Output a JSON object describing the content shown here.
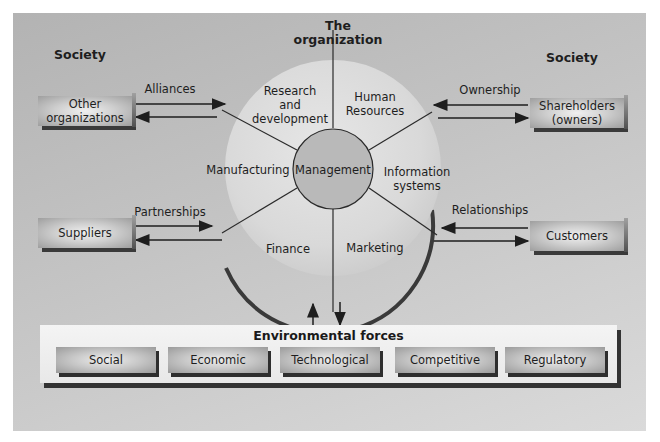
{
  "title": "The\norganization",
  "society_left": "Society",
  "society_right": "Society",
  "organization": {
    "center": "Management",
    "segments": [
      {
        "label": "Research\nand\ndevelopment"
      },
      {
        "label": "Human\nResources"
      },
      {
        "label": "Information\nsystems"
      },
      {
        "label": "Marketing"
      },
      {
        "label": "Finance"
      },
      {
        "label": "Manufacturing"
      }
    ]
  },
  "external": [
    {
      "name": "Other\norganizations",
      "relation": "Alliances"
    },
    {
      "name": "Suppliers",
      "relation": "Partnerships"
    },
    {
      "name": "Shareholders\n(owners)",
      "relation": "Ownership"
    },
    {
      "name": "Customers",
      "relation": "Relationships"
    }
  ],
  "environment": {
    "title": "Environmental forces",
    "forces": [
      "Social",
      "Economic",
      "Technological",
      "Competitive",
      "Regulatory"
    ]
  },
  "colors": {
    "background": "#c4c4c4",
    "circle": "#dcdcdc",
    "center": "#b8b8b8",
    "line": "#2a2a2a"
  }
}
